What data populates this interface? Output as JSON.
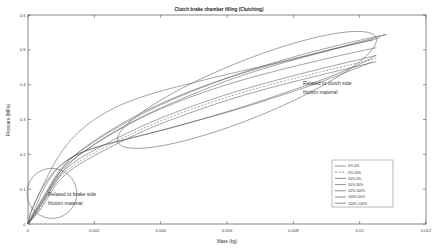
{
  "chart_data": {
    "type": "line",
    "title": "Clutch brake chamber filling (Clutching)",
    "xlabel": "Mass (kg)",
    "ylabel": "Pressure (MPa)",
    "xlim": [
      0,
      0.012
    ],
    "ylim": [
      0,
      0.6
    ],
    "grid": false,
    "legend_position": "lower-right",
    "xticks": [
      0,
      0.002,
      0.004,
      0.006,
      0.008,
      0.01,
      0.012
    ],
    "xticklabels": [
      "0",
      "0.002",
      "0.004",
      "0.006",
      "0.008",
      "0.01",
      "0.012"
    ],
    "yticks": [
      0,
      0.1,
      0.2,
      0.3,
      0.4,
      0.5,
      0.6
    ],
    "yticklabels": [
      "0",
      "0.1",
      "0.2",
      "0.3",
      "0.4",
      "0.5",
      "0.6"
    ],
    "annotations": [
      {
        "name": "clutch-side-annotation",
        "text_line1": "Related to clutch side",
        "text_line2": "friction material",
        "x": 0.0077,
        "y": 0.255
      },
      {
        "name": "brake-side-annotation",
        "text_line1": "Related to brake side",
        "text_line2": "friction material",
        "x": 0.0012,
        "y": 0.105
      }
    ],
    "highlight_ellipses": [
      {
        "name": "brake-side-ellipse",
        "cx": 0.00072,
        "cy": 0.088,
        "rx": 0.00075,
        "ry": 0.072,
        "rotation_deg": -28
      },
      {
        "name": "clutch-side-ellipse",
        "cx": 0.0066,
        "cy": 0.385,
        "rx": 0.0042,
        "ry": 0.082,
        "rotation_deg": -22
      }
    ],
    "series": [
      {
        "name": "0%-0%",
        "style": "solid",
        "points": [
          [
            0,
            0
          ],
          [
            0.0004,
            0.055
          ],
          [
            0.0009,
            0.135
          ],
          [
            0.0014,
            0.178
          ],
          [
            0.002,
            0.212
          ],
          [
            0.0028,
            0.252
          ],
          [
            0.0038,
            0.296
          ],
          [
            0.005,
            0.34
          ],
          [
            0.0062,
            0.378
          ],
          [
            0.0075,
            0.413
          ],
          [
            0.0088,
            0.445
          ],
          [
            0.0098,
            0.468
          ],
          [
            0.0105,
            0.484
          ]
        ]
      },
      {
        "name": "0%-50%",
        "style": "dashed",
        "points": [
          [
            0,
            0
          ],
          [
            0.0004,
            0.05
          ],
          [
            0.0009,
            0.128
          ],
          [
            0.0014,
            0.17
          ],
          [
            0.002,
            0.204
          ],
          [
            0.0028,
            0.244
          ],
          [
            0.0038,
            0.288
          ],
          [
            0.005,
            0.332
          ],
          [
            0.0062,
            0.37
          ],
          [
            0.0075,
            0.405
          ],
          [
            0.0088,
            0.436
          ],
          [
            0.0098,
            0.459
          ],
          [
            0.0105,
            0.475
          ]
        ]
      },
      {
        "name": "50%-0%",
        "style": "solid-light",
        "points": [
          [
            0,
            0
          ],
          [
            0.0004,
            0.045
          ],
          [
            0.0009,
            0.12
          ],
          [
            0.0014,
            0.162
          ],
          [
            0.002,
            0.196
          ],
          [
            0.0028,
            0.236
          ],
          [
            0.0038,
            0.28
          ],
          [
            0.005,
            0.323
          ],
          [
            0.0062,
            0.361
          ],
          [
            0.0075,
            0.396
          ],
          [
            0.0088,
            0.427
          ],
          [
            0.0098,
            0.45
          ],
          [
            0.0105,
            0.466
          ]
        ]
      },
      {
        "name": "50%-50%",
        "style": "solid",
        "points": [
          [
            0,
            0
          ],
          [
            0.0004,
            0.06
          ],
          [
            0.0009,
            0.142
          ],
          [
            0.0014,
            0.188
          ],
          [
            0.002,
            0.228
          ],
          [
            0.0028,
            0.274
          ],
          [
            0.0038,
            0.322
          ],
          [
            0.005,
            0.368
          ],
          [
            0.0062,
            0.406
          ],
          [
            0.0075,
            0.44
          ],
          [
            0.0088,
            0.47
          ],
          [
            0.0098,
            0.492
          ],
          [
            0.0105,
            0.506
          ]
        ]
      },
      {
        "name": "50%-100%",
        "style": "solid-light",
        "points": [
          [
            0,
            0
          ],
          [
            0.0004,
            0.068
          ],
          [
            0.001,
            0.16
          ],
          [
            0.0016,
            0.212
          ],
          [
            0.0023,
            0.258
          ],
          [
            0.0032,
            0.308
          ],
          [
            0.0043,
            0.358
          ],
          [
            0.0056,
            0.406
          ],
          [
            0.007,
            0.448
          ],
          [
            0.0084,
            0.484
          ],
          [
            0.0096,
            0.512
          ],
          [
            0.0104,
            0.528
          ]
        ]
      },
      {
        "name": "100%-50%",
        "style": "solid-light",
        "points": [
          [
            0,
            0
          ],
          [
            0.0005,
            0.072
          ],
          [
            0.0012,
            0.168
          ],
          [
            0.0019,
            0.222
          ],
          [
            0.0027,
            0.27
          ],
          [
            0.0037,
            0.32
          ],
          [
            0.0049,
            0.37
          ],
          [
            0.0062,
            0.418
          ],
          [
            0.0076,
            0.46
          ],
          [
            0.009,
            0.496
          ],
          [
            0.01,
            0.52
          ],
          [
            0.0106,
            0.534
          ]
        ]
      },
      {
        "name": "100%-100%",
        "style": "solid",
        "points": [
          [
            0,
            0
          ],
          [
            0.0005,
            0.08
          ],
          [
            0.0012,
            0.178
          ],
          [
            0.002,
            0.236
          ],
          [
            0.0029,
            0.288
          ],
          [
            0.004,
            0.342
          ],
          [
            0.0053,
            0.394
          ],
          [
            0.0067,
            0.442
          ],
          [
            0.0081,
            0.482
          ],
          [
            0.0094,
            0.514
          ],
          [
            0.0103,
            0.534
          ],
          [
            0.0108,
            0.544
          ]
        ]
      }
    ],
    "return_branches": [
      {
        "name": "lower-return-branch",
        "points": [
          [
            0.0105,
            0.484
          ],
          [
            0.0098,
            0.45
          ],
          [
            0.0088,
            0.412
          ],
          [
            0.0076,
            0.372
          ],
          [
            0.0064,
            0.334
          ],
          [
            0.0052,
            0.3
          ],
          [
            0.004,
            0.268
          ],
          [
            0.003,
            0.244
          ],
          [
            0.0021,
            0.222
          ],
          [
            0.0014,
            0.196
          ],
          [
            0.0009,
            0.16
          ],
          [
            0.0005,
            0.105
          ],
          [
            0.0002,
            0.042
          ],
          [
            0,
            0
          ]
        ]
      },
      {
        "name": "inner-return-branch",
        "points": [
          [
            0.0104,
            0.466
          ],
          [
            0.0096,
            0.436
          ],
          [
            0.0086,
            0.4
          ],
          [
            0.0074,
            0.362
          ],
          [
            0.0062,
            0.326
          ],
          [
            0.005,
            0.294
          ],
          [
            0.0039,
            0.266
          ],
          [
            0.0029,
            0.242
          ],
          [
            0.002,
            0.218
          ],
          [
            0.0013,
            0.19
          ],
          [
            0.0008,
            0.152
          ],
          [
            0.0004,
            0.098
          ],
          [
            0.0001,
            0.038
          ],
          [
            0,
            0
          ]
        ]
      },
      {
        "name": "outer-shoulder-branch",
        "points": [
          [
            0.0108,
            0.544
          ],
          [
            0.0099,
            0.52
          ],
          [
            0.0088,
            0.492
          ],
          [
            0.0075,
            0.462
          ],
          [
            0.0062,
            0.434
          ],
          [
            0.005,
            0.406
          ],
          [
            0.0038,
            0.376
          ],
          [
            0.0028,
            0.342
          ],
          [
            0.002,
            0.3
          ],
          [
            0.0014,
            0.252
          ],
          [
            0.001,
            0.205
          ],
          [
            0.0007,
            0.158
          ],
          [
            0.0004,
            0.1
          ],
          [
            0.0001,
            0.036
          ],
          [
            0,
            0
          ]
        ]
      }
    ]
  }
}
